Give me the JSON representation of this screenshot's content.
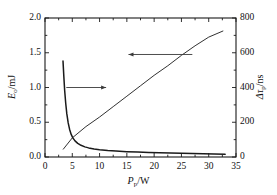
{
  "chart_data": {
    "type": "line",
    "title": "",
    "xlabel": "P_p / W",
    "xlabel_main": "P",
    "xlabel_sub": "p",
    "xlabel_unit": "/W",
    "ylabel_left": "E_o / mJ",
    "ylabel_left_main": "E",
    "ylabel_left_sub": "o",
    "ylabel_left_unit": "/mJ",
    "ylabel_right": "Δτ_p / ns",
    "ylabel_right_main": "Δτ",
    "ylabel_right_sub": "p",
    "ylabel_right_unit": "/ns",
    "xlim": [
      0,
      35
    ],
    "ylim_left": [
      0.0,
      2.0
    ],
    "ylim_right": [
      0,
      800
    ],
    "xticks": [
      0,
      5,
      10,
      15,
      20,
      25,
      30,
      35
    ],
    "xticklabels": [
      "0",
      "5",
      "10",
      "15",
      "20",
      "25",
      "30",
      "35"
    ],
    "yticks_left": [
      0.0,
      0.5,
      1.0,
      1.5,
      2.0
    ],
    "yticklabels_left": [
      "0.0",
      "0.5",
      "1.0",
      "1.5",
      "2.0"
    ],
    "yticks_right": [
      0,
      200,
      400,
      600,
      800
    ],
    "yticklabels_right": [
      "0",
      "200",
      "400",
      "600",
      "800"
    ],
    "grid": false,
    "legend": "none",
    "frame": "box",
    "line_color": "#1a1a1a",
    "series": [
      {
        "name": "pulse width (right axis)",
        "axis": "right",
        "style": "solid",
        "points": [
          [
            3.35,
            45
          ],
          [
            5.0,
            110
          ],
          [
            7.5,
            175
          ],
          [
            10.0,
            230
          ],
          [
            12.5,
            290
          ],
          [
            15.0,
            350
          ],
          [
            17.5,
            410
          ],
          [
            20.0,
            470
          ],
          [
            22.5,
            525
          ],
          [
            25.0,
            585
          ],
          [
            27.5,
            640
          ],
          [
            30.0,
            690
          ],
          [
            32.6,
            725
          ]
        ]
      },
      {
        "name": "output energy (left axis)",
        "axis": "left",
        "style": "solid",
        "points": [
          [
            3.3,
            1.38
          ],
          [
            3.45,
            1.16
          ],
          [
            3.6,
            0.96
          ],
          [
            3.8,
            0.77
          ],
          [
            4.0,
            0.62
          ],
          [
            4.25,
            0.49
          ],
          [
            4.5,
            0.4
          ],
          [
            4.8,
            0.325
          ],
          [
            5.1,
            0.275
          ],
          [
            5.5,
            0.232
          ],
          [
            6.0,
            0.196
          ],
          [
            6.6,
            0.168
          ],
          [
            7.3,
            0.146
          ],
          [
            8.0,
            0.131
          ],
          [
            9.0,
            0.116
          ],
          [
            10.0,
            0.105
          ],
          [
            11.5,
            0.093
          ],
          [
            13.0,
            0.085
          ],
          [
            15.0,
            0.077
          ],
          [
            17.0,
            0.071
          ],
          [
            19.0,
            0.066
          ],
          [
            21.0,
            0.061
          ],
          [
            23.0,
            0.057
          ],
          [
            25.0,
            0.053
          ],
          [
            27.0,
            0.049
          ],
          [
            29.0,
            0.046
          ],
          [
            31.0,
            0.042
          ],
          [
            33.0,
            0.038
          ]
        ]
      }
    ],
    "annotations": [
      {
        "name": "arrow-to-left-axis",
        "direction": "right",
        "note": "arrow pointing right toward the decaying energy curve",
        "x_start": 3.9,
        "x_end": 11.2,
        "y_left": 1.0
      },
      {
        "name": "arrow-to-right-axis",
        "direction": "left",
        "note": "arrow pointing left toward the linear pulse-width line",
        "x_start": 27.0,
        "x_end": 15.3,
        "y_right": 590
      }
    ]
  }
}
